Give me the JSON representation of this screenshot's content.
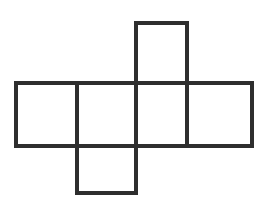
{
  "figure": {
    "name": "cube-net-diagram",
    "canvas": {
      "width": 277,
      "height": 215,
      "background_color": "#ffffff"
    },
    "style": {
      "stroke_color": "#2e2e2e",
      "stroke_width": 4,
      "fill_color": "#ffffff"
    },
    "face_count": 6,
    "faces": [
      {
        "name": "top-face",
        "position": "top",
        "x": 136,
        "y": 23,
        "width": 51,
        "height": 60
      },
      {
        "name": "row-face-1",
        "position": "middle-left-1",
        "x": 16,
        "y": 83,
        "width": 61,
        "height": 63
      },
      {
        "name": "row-face-2",
        "position": "middle-left-2",
        "x": 77,
        "y": 83,
        "width": 59,
        "height": 63
      },
      {
        "name": "row-face-3",
        "position": "middle-right-1",
        "x": 136,
        "y": 83,
        "width": 51,
        "height": 63
      },
      {
        "name": "row-face-4",
        "position": "middle-right-2",
        "x": 187,
        "y": 83,
        "width": 65,
        "height": 63
      },
      {
        "name": "bottom-face",
        "position": "bottom",
        "x": 77,
        "y": 146,
        "width": 59,
        "height": 47
      }
    ],
    "edges": {
      "outer_path": "M136,23 L187,23 L187,83 L252,83 L252,146 L136,146 L136,193 L77,193 L77,146 L16,146 L16,83 L136,83 Z",
      "inner_lines": [
        {
          "name": "divider-vertical-1",
          "x1": 77,
          "y1": 83,
          "x2": 77,
          "y2": 146
        },
        {
          "name": "divider-vertical-2",
          "x1": 136,
          "y1": 83,
          "x2": 136,
          "y2": 146
        },
        {
          "name": "divider-vertical-3",
          "x1": 187,
          "y1": 83,
          "x2": 187,
          "y2": 146
        },
        {
          "name": "divider-horizontal-top",
          "x1": 136,
          "y1": 83,
          "x2": 187,
          "y2": 83
        },
        {
          "name": "divider-horizontal-bottom",
          "x1": 77,
          "y1": 146,
          "x2": 136,
          "y2": 146
        }
      ]
    }
  }
}
